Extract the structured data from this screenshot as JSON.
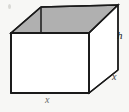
{
  "figure": {
    "type": "geometry-diagram",
    "background_color": "#f7f7f5",
    "outline_color": "#1a1a1a",
    "top_face_fill": "#b0b0b0",
    "front_face_fill": "#ffffff",
    "labels": [
      {
        "id": "height",
        "text": "h",
        "position": "right-vertical-edge"
      },
      {
        "id": "depth",
        "text": "x",
        "position": "right-depth-diagonal"
      },
      {
        "id": "width",
        "text": "x",
        "position": "bottom-front-edge"
      }
    ],
    "geometry": {
      "front_face": "11,33 89,33 89,93 11,93",
      "top_face": "11,33 41,7 118,5 89,33",
      "right_face": "89,33 118,5 118,70 89,93",
      "rear_left_vertical": "41,7 41,33"
    }
  }
}
